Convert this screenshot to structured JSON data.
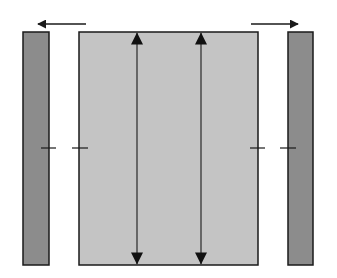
{
  "diagram": {
    "colors": {
      "background": "#ffffff",
      "side_bar_fill": "#8c8c8c",
      "center_fill": "#c4c4c4",
      "stroke": "#1a1a1a"
    },
    "elements": {
      "left_bar": {
        "x": 23,
        "y": 32,
        "w": 26,
        "h": 233
      },
      "center_block": {
        "x": 79,
        "y": 32,
        "w": 179,
        "h": 233
      },
      "right_bar": {
        "x": 288,
        "y": 32,
        "w": 25,
        "h": 233
      },
      "arrow_left": {
        "x1": 86,
        "x2": 38,
        "y": 24,
        "direction": "left"
      },
      "arrow_right": {
        "x1": 251,
        "x2": 298,
        "y": 24,
        "direction": "right"
      },
      "vertical_arrows": [
        {
          "x": 137,
          "y1": 32,
          "y2": 265,
          "direction": "both"
        },
        {
          "x": 201,
          "y1": 32,
          "y2": 265,
          "direction": "both"
        }
      ],
      "ticks": [
        {
          "x1": 41,
          "x2": 56,
          "y": 148
        },
        {
          "x1": 72,
          "x2": 88,
          "y": 148
        },
        {
          "x1": 250,
          "x2": 265,
          "y": 148
        },
        {
          "x1": 280,
          "x2": 296,
          "y": 148
        }
      ]
    }
  }
}
